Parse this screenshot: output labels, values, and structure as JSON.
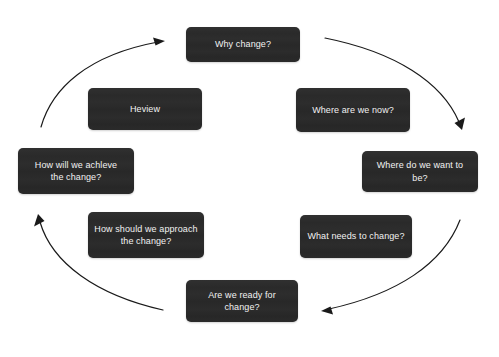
{
  "diagram": {
    "type": "cycle",
    "background_color": "#ffffff",
    "box_fill_color": "#2b2b2b",
    "box_text_color": "#f2f2f2",
    "arrow_color": "#1a1a1a",
    "stages": [
      {
        "id": "why-change",
        "label": "Why change?",
        "order": 1,
        "x": 186,
        "y": 27,
        "width": 114,
        "height": 35
      },
      {
        "id": "where-are-we-now",
        "label": "Where are we now?",
        "order": 2,
        "x": 296,
        "y": 88,
        "width": 114,
        "height": 44
      },
      {
        "id": "where-do-we-want-to-be",
        "label": "Where do we want to be?",
        "order": 3,
        "x": 362,
        "y": 151,
        "width": 116,
        "height": 41
      },
      {
        "id": "what-needs-to-change",
        "label": "What needs to change?",
        "order": 4,
        "x": 300,
        "y": 215,
        "width": 112,
        "height": 43
      },
      {
        "id": "are-we-ready-for-change",
        "label": "Are we ready for change?",
        "order": 5,
        "x": 186,
        "y": 280,
        "width": 112,
        "height": 42
      },
      {
        "id": "how-should-we-approach-the-change",
        "label": "How should we approach\nthe change?",
        "order": 6,
        "x": 88,
        "y": 212,
        "width": 116,
        "height": 46
      },
      {
        "id": "how-will-we-achieve-the-change",
        "label": "How will we achleve\nthe change?",
        "order": 7,
        "x": 18,
        "y": 148,
        "width": 116,
        "height": 46
      },
      {
        "id": "review",
        "label": "Heview",
        "order": 8,
        "x": 88,
        "y": 88,
        "width": 114,
        "height": 42
      }
    ],
    "arrows": [
      {
        "id": "arrow-top-right",
        "from_stage": "why-change",
        "to_stage": "where-do-we-want-to-be",
        "direction": "clockwise-down-right"
      },
      {
        "id": "arrow-bottom-right",
        "from_stage": "what-needs-to-change",
        "to_stage": "are-we-ready-for-change",
        "direction": "clockwise-down-left"
      },
      {
        "id": "arrow-bottom-left",
        "from_stage": "are-we-ready-for-change",
        "to_stage": "how-will-we-achieve-the-change",
        "direction": "clockwise-up-left"
      },
      {
        "id": "arrow-top-left",
        "from_stage": "review",
        "to_stage": "why-change",
        "direction": "clockwise-up-right"
      }
    ]
  }
}
